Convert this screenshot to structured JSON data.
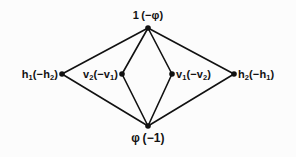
{
  "diagram": {
    "type": "nested-rhombus-graph",
    "background_color": "#fcfcfc",
    "edge_color": "#111111",
    "vertex_color": "#111111",
    "edge_width": 1.6,
    "vertex_radius": 2.6,
    "vertices": [
      {
        "id": "top",
        "name": "top-vertex",
        "x": 148,
        "y": 28,
        "label_main": "1",
        "label_paren": "(−φ)"
      },
      {
        "id": "outer-left",
        "name": "outer-left-vertex",
        "x": 62,
        "y": 74,
        "label_main": "h",
        "label_sub": "1",
        "label_paren": "(−h",
        "label_paren_sub": "2",
        "label_close": ")"
      },
      {
        "id": "inner-left",
        "name": "inner-left-vertex",
        "x": 122,
        "y": 74,
        "label_main": "v",
        "label_sub": "2",
        "label_paren": "(−v",
        "label_paren_sub": "1",
        "label_close": ")"
      },
      {
        "id": "inner-right",
        "name": "inner-right-vertex",
        "x": 172,
        "y": 74,
        "label_main": "v",
        "label_sub": "1",
        "label_paren": "(−v",
        "label_paren_sub": "2",
        "label_close": ")"
      },
      {
        "id": "outer-right",
        "name": "outer-right-vertex",
        "x": 234,
        "y": 74,
        "label_main": "h",
        "label_sub": "2",
        "label_paren": "(−h",
        "label_paren_sub": "1",
        "label_close": ")"
      },
      {
        "id": "bottom",
        "name": "bottom-vertex",
        "x": 148,
        "y": 126,
        "label_main": "φ",
        "label_paren": "(−1)"
      }
    ],
    "edges": [
      {
        "from": "top",
        "to": "outer-left",
        "name": "edge-top-outer-left"
      },
      {
        "from": "top",
        "to": "inner-left",
        "name": "edge-top-inner-left"
      },
      {
        "from": "top",
        "to": "inner-right",
        "name": "edge-top-inner-right"
      },
      {
        "from": "top",
        "to": "outer-right",
        "name": "edge-top-outer-right"
      },
      {
        "from": "outer-left",
        "to": "bottom",
        "name": "edge-outer-left-bottom"
      },
      {
        "from": "inner-left",
        "to": "bottom",
        "name": "edge-inner-left-bottom"
      },
      {
        "from": "inner-right",
        "to": "bottom",
        "name": "edge-inner-right-bottom"
      },
      {
        "from": "outer-right",
        "to": "bottom",
        "name": "edge-outer-right-bottom"
      }
    ]
  },
  "labels": {
    "top": {
      "base": "1",
      "paren": "(−φ)",
      "full": "1 (−φ)"
    },
    "bottom": {
      "base": "φ",
      "paren": "(−1)",
      "full": "φ (−1)"
    },
    "outer_left": {
      "base": "h",
      "base_sub": "1",
      "paren_open": "(−h",
      "paren_sub": "2",
      "paren_close": ")",
      "full": "h₁(−h₂)"
    },
    "outer_right": {
      "base": "h",
      "base_sub": "2",
      "paren_open": "(−h",
      "paren_sub": "1",
      "paren_close": ")",
      "full": "h₂(−h₁)"
    },
    "inner_left": {
      "base": "v",
      "base_sub": "2",
      "paren_open": "(−v",
      "paren_sub": "1",
      "paren_close": ")",
      "full": "v₂(−v₁)"
    },
    "inner_right": {
      "base": "v",
      "base_sub": "1",
      "paren_open": "(−v",
      "paren_sub": "2",
      "paren_close": ")",
      "full": "v₁(−v₂)"
    }
  }
}
